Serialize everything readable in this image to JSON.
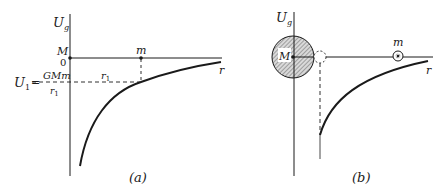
{
  "figure": {
    "panel_a": {
      "caption": "(a)",
      "y_axis_label": "U",
      "y_axis_label_sub": "g",
      "x_axis_label": "r",
      "origin_mass_label": "M",
      "zero_label": "0",
      "test_mass_label": "m",
      "distance_label": "r",
      "distance_label_sub": "1",
      "energy_label": "U",
      "energy_label_sub": "1",
      "equals": "=",
      "minus": "−",
      "fraction_numerator": "GMm",
      "fraction_denominator": "r",
      "fraction_denominator_sub": "1"
    },
    "panel_b": {
      "caption": "(b)",
      "y_axis_label": "U",
      "y_axis_label_sub": "g",
      "x_axis_label": "r",
      "central_mass_label": "M",
      "test_mass_label": "m"
    },
    "colors": {
      "ink": "#1a1a1a",
      "background": "#ffffff",
      "hatch_fill": "#d9d9d9"
    }
  }
}
